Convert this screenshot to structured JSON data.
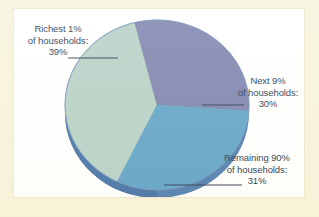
{
  "chart_data": {
    "type": "pie",
    "title": "",
    "subtitle": "",
    "xlabel": "",
    "ylabel": "",
    "legend_position": "callout-labels",
    "grid": false,
    "style": "3d-ellipse",
    "categories": [
      "Richest 1% of households",
      "Next 9% of households",
      "Remaining 90% of households"
    ],
    "values": [
      39,
      30,
      31
    ],
    "value_unit": "%",
    "colors": [
      "#b4cfc4",
      "#7a7fab",
      "#5ba0c6"
    ],
    "slices": [
      {
        "name": "Richest 1% of households",
        "value": 39,
        "value_text": "39%",
        "color": "#b4cfc4",
        "label_line1": "Richest 1%",
        "label_line2": "of households:",
        "label_line3": "39%"
      },
      {
        "name": "Next 9% of households",
        "value": 30,
        "value_text": "30%",
        "color": "#7a7fab",
        "label_line1": "Next 9%",
        "label_line2": "of households:",
        "label_line3": "30%"
      },
      {
        "name": "Remaining 90% of households",
        "value": 31,
        "value_text": "31%",
        "color": "#5ba0c6",
        "label_line1": "Remaining 90%",
        "label_line2": "of households:",
        "label_line3": "31%"
      }
    ]
  },
  "figure": {
    "panel_background": "#ffffff",
    "border_color": "#f7f3da",
    "text_color": "#20304a",
    "side_color": "#4a79ad",
    "leader_line_color": "#26354c"
  }
}
